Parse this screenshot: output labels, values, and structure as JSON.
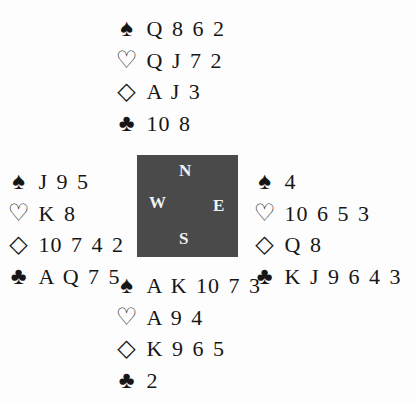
{
  "hands": {
    "north": {
      "spades": "Q 8 6 2",
      "hearts": "Q J 7 2",
      "diamonds": "A J 3",
      "clubs": "10 8"
    },
    "west": {
      "spades": "J 9 5",
      "hearts": "K 8",
      "diamonds": "10 7 4 2",
      "clubs": "A Q 7 5"
    },
    "east": {
      "spades": "4",
      "hearts": "10 6 5 3",
      "diamonds": "Q 8",
      "clubs": "K J 9 6 4 3"
    },
    "south": {
      "spades": "A K 10 7 3",
      "hearts": "A 9 4",
      "diamonds": "K 9 6 5",
      "clubs": "2"
    }
  },
  "suit_symbols": {
    "spades": "♠",
    "hearts": "♡",
    "diamonds": "◇",
    "clubs": "♣"
  },
  "compass": {
    "north": "N",
    "west": "W",
    "east": "E",
    "south": "S",
    "color": "#4a4a4a"
  }
}
